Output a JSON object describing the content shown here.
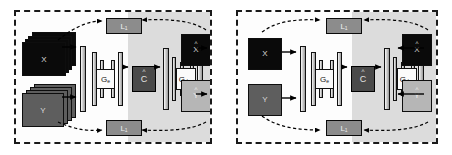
{
  "figure": {
    "panels": [
      {
        "id": "left",
        "inputs_stacked": true,
        "inputs": [
          {
            "label": "X",
            "tone": "dark"
          },
          {
            "label": "Y",
            "tone": "mid"
          }
        ],
        "encoder": {
          "label": "G",
          "subscript": "e"
        },
        "code": {
          "label": "C",
          "hat": true
        },
        "decoder": {
          "label": "G",
          "subscript": "dec"
        },
        "outputs": [
          {
            "label": "X",
            "hat": true,
            "tone": "dark"
          },
          {
            "label": "Y",
            "hat": true,
            "tone": "light"
          }
        ],
        "losses": [
          {
            "label": "L",
            "subscript": "1",
            "position": "top"
          },
          {
            "label": "L",
            "subscript": "1",
            "position": "bottom"
          }
        ]
      },
      {
        "id": "right",
        "inputs_stacked": false,
        "inputs": [
          {
            "label": "X",
            "tone": "dark"
          },
          {
            "label": "Y",
            "tone": "mid"
          }
        ],
        "encoder": {
          "label": "G",
          "subscript": "e"
        },
        "code": {
          "label": "C",
          "hat": true
        },
        "decoder": {
          "label": "G",
          "subscript": "dec"
        },
        "outputs": [
          {
            "label": "X",
            "hat": true,
            "tone": "dark"
          },
          {
            "label": "Y",
            "hat": true,
            "tone": "light"
          }
        ],
        "losses": [
          {
            "label": "L",
            "subscript": "1",
            "position": "top"
          },
          {
            "label": "L",
            "subscript": "1",
            "position": "bottom"
          }
        ]
      }
    ],
    "colors": {
      "panel_border": "#1a1a1a",
      "panel_background": "#fdfdfd",
      "decoder_shade": "#dcdcdc",
      "tile_dark": "#0a0a0a",
      "tile_mid": "#5e5e5e",
      "tile_light": "#b6b6b6",
      "code_box": "#4a4a4a",
      "loss_box": "#8c8c8c",
      "layer_bar": "#cccccc",
      "arrow": "#000000"
    }
  }
}
